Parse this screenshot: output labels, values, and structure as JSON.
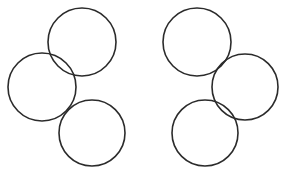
{
  "figure": {
    "canvas": {
      "width": 287,
      "height": 179,
      "background_color": "#ffffff"
    },
    "style": {
      "stroke_color": "#2b2b2b",
      "stroke_width": 1.6,
      "fill": "none"
    },
    "caption": "",
    "groups": [
      {
        "name": "left-cluster",
        "label": "Left group",
        "circles": [
          {
            "name": "left-top-circle",
            "label": "Left group top circle",
            "cx": 82,
            "cy": 42,
            "r": 34
          },
          {
            "name": "left-middle-circle",
            "label": "Left group middle circle",
            "cx": 42,
            "cy": 87,
            "r": 34
          },
          {
            "name": "left-bottom-circle",
            "label": "Left group bottom circle",
            "cx": 92,
            "cy": 133,
            "r": 33
          }
        ]
      },
      {
        "name": "right-cluster",
        "label": "Right group",
        "circles": [
          {
            "name": "right-top-circle",
            "label": "Right group top circle",
            "cx": 197,
            "cy": 42,
            "r": 34
          },
          {
            "name": "right-middle-circle",
            "label": "Right group middle circle",
            "cx": 245,
            "cy": 87,
            "r": 33
          },
          {
            "name": "right-bottom-circle",
            "label": "Right group bottom circle",
            "cx": 205,
            "cy": 133,
            "r": 33
          }
        ]
      }
    ]
  }
}
